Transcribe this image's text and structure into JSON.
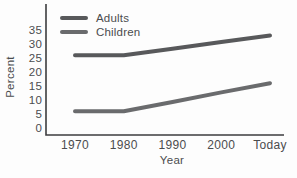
{
  "colors": {
    "background": "#fdfdfd",
    "axis": "#3c3d3f",
    "text": "#4b4c4e"
  },
  "chart_data": {
    "type": "line",
    "title": "",
    "xlabel": "Year",
    "ylabel": "Percent",
    "categories": [
      "1970",
      "1980",
      "1990",
      "2000",
      "Today"
    ],
    "y_ticks": [
      0,
      5,
      10,
      15,
      20,
      25,
      30,
      35
    ],
    "ylim": [
      0,
      37
    ],
    "grid": false,
    "legend_position": "top-left",
    "series": [
      {
        "name": "Adults",
        "color": "#58595b",
        "values": [
          26,
          26,
          28.3,
          30.7,
          33
        ]
      },
      {
        "name": "Children",
        "color": "#6a6b6d",
        "values": [
          6,
          6,
          9.3,
          12.7,
          16
        ]
      }
    ]
  }
}
